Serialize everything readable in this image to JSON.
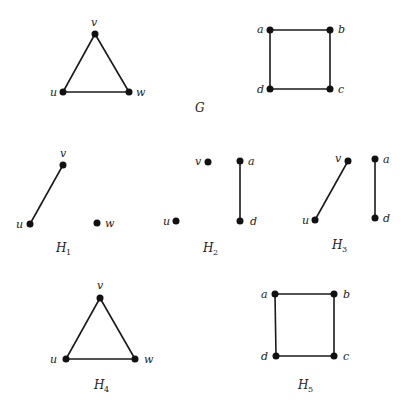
{
  "figure": {
    "graph_G": {
      "title": "G",
      "triangle": {
        "labels": {
          "u": "u",
          "v": "v",
          "w": "w"
        }
      },
      "square": {
        "labels": {
          "a": "a",
          "b": "b",
          "c": "c",
          "d": "d"
        }
      }
    },
    "subgraphs": [
      {
        "name": "H",
        "sub": "1",
        "vertices": [
          "u",
          "v",
          "w"
        ],
        "edges": [
          [
            "u",
            "v"
          ]
        ]
      },
      {
        "name": "H",
        "sub": "2",
        "vertices": [
          "u",
          "v",
          "a",
          "d"
        ],
        "edges": [
          [
            "a",
            "d"
          ]
        ]
      },
      {
        "name": "H",
        "sub": "3",
        "vertices": [
          "u",
          "v",
          "a",
          "d"
        ],
        "edges": [
          [
            "u",
            "v"
          ],
          [
            "a",
            "d"
          ]
        ]
      },
      {
        "name": "H",
        "sub": "4",
        "vertices": [
          "u",
          "v",
          "w"
        ],
        "edges": [
          [
            "u",
            "v"
          ],
          [
            "v",
            "w"
          ],
          [
            "u",
            "w"
          ]
        ]
      },
      {
        "name": "H",
        "sub": "5",
        "vertices": [
          "a",
          "b",
          "c",
          "d"
        ],
        "edges": [
          [
            "a",
            "b"
          ],
          [
            "b",
            "c"
          ],
          [
            "c",
            "d"
          ],
          [
            "d",
            "a"
          ]
        ]
      }
    ],
    "labels": {
      "u": "u",
      "v": "v",
      "w": "w",
      "a": "a",
      "b": "b",
      "c": "c",
      "d": "d"
    },
    "caption": ""
  }
}
